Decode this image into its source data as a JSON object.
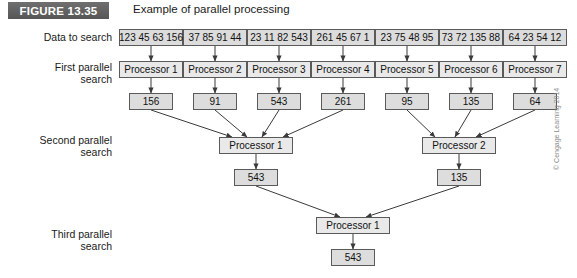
{
  "figure": {
    "badge": "FIGURE 13.35",
    "caption": "Example of parallel processing"
  },
  "labels": {
    "data_to_search": "Data to search",
    "first_parallel_search": "First parallel\nsearch",
    "second_parallel_search": "Second parallel\nsearch",
    "third_parallel_search": "Third parallel\nsearch"
  },
  "diagram": {
    "data_segments": [
      "123 45 63 156",
      "37 85 91 44",
      "23 11 82 543",
      "261 45 67 1",
      "23 75 48 95",
      "73 72 135 88",
      "64 23 54 12"
    ],
    "first_processors": [
      "Processor 1",
      "Processor 2",
      "Processor 3",
      "Processor 4",
      "Processor 5",
      "Processor 6",
      "Processor 7"
    ],
    "first_results": [
      "156",
      "91",
      "543",
      "261",
      "95",
      "135",
      "64"
    ],
    "second_processors": [
      "Processor 1",
      "Processor 2"
    ],
    "second_results": [
      "543",
      "135"
    ],
    "third_processor": "Processor 1",
    "third_result": "543"
  },
  "copyright": "© Cengage Learning 2014",
  "colors": {
    "badge_bg": "#626262",
    "box_border": "#5a5a5a",
    "data_box_bg": "#dcdcdc",
    "processor_box_bg": "#e9e9e9",
    "result_box_bg": "#dddddd",
    "arrow": "#3a3a3a"
  }
}
